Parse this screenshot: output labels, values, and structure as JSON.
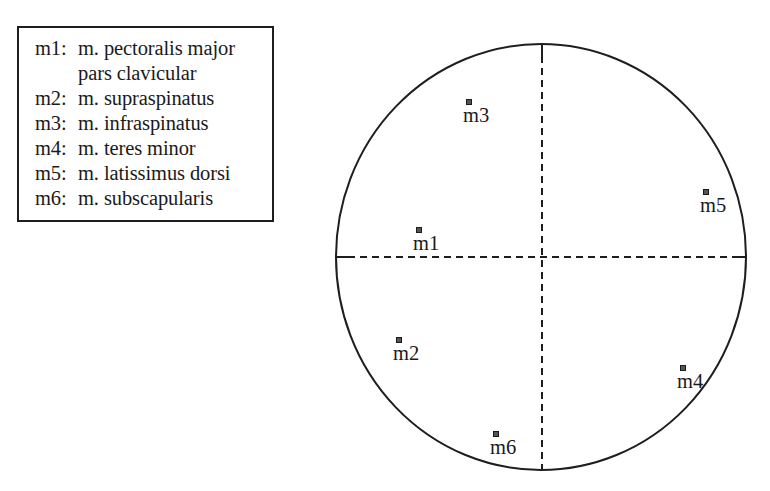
{
  "legend": {
    "entries": [
      {
        "code": "m1:",
        "name": "m. pectoralis major",
        "continuation": "pars clavicular"
      },
      {
        "code": "m2:",
        "name": "m. supraspinatus"
      },
      {
        "code": "m3:",
        "name": "m. infraspinatus"
      },
      {
        "code": "m4:",
        "name": "m. teres minor"
      },
      {
        "code": "m5:",
        "name": "m. latissimus dorsi"
      },
      {
        "code": "m6:",
        "name": "m. subscapularis"
      }
    ]
  },
  "diagram": {
    "circle": {
      "cx": 541,
      "cy": 257,
      "rx": 205,
      "ry": 213
    },
    "axes": {
      "style": "dashed",
      "color": "#1e1e1e"
    },
    "points": [
      {
        "label": "m1",
        "x": 419,
        "y": 230
      },
      {
        "label": "m2",
        "x": 399,
        "y": 340
      },
      {
        "label": "m3",
        "x": 469,
        "y": 102
      },
      {
        "label": "m4",
        "x": 683,
        "y": 368
      },
      {
        "label": "m5",
        "x": 706,
        "y": 192
      },
      {
        "label": "m6",
        "x": 496,
        "y": 434
      }
    ]
  },
  "chart_data": {
    "type": "scatter",
    "title": "",
    "xlabel": "",
    "ylabel": "",
    "frame": "circle with dashed crosshair axes through center",
    "points_relative_to_center_normalized": [
      {
        "label": "m1",
        "x": -0.6,
        "y": 0.13
      },
      {
        "label": "m2",
        "x": -0.69,
        "y": -0.39
      },
      {
        "label": "m3",
        "x": -0.35,
        "y": 0.73
      },
      {
        "label": "m4",
        "x": 0.69,
        "y": -0.52
      },
      {
        "label": "m5",
        "x": 0.81,
        "y": 0.31
      },
      {
        "label": "m6",
        "x": -0.22,
        "y": -0.83
      }
    ],
    "legend": [
      "m1: m. pectoralis major pars clavicular",
      "m2: m. supraspinatus",
      "m3: m. infraspinatus",
      "m4: m. teres minor",
      "m5: m. latissimus dorsi",
      "m6: m. subscapularis"
    ]
  }
}
